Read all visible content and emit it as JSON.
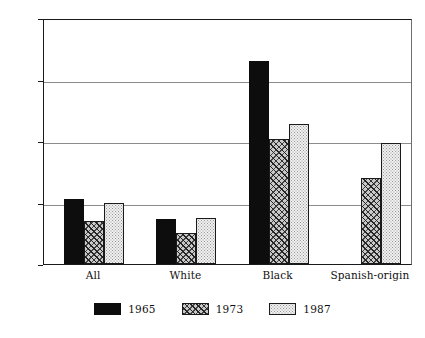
{
  "chart_data": {
    "type": "bar",
    "title": "",
    "subtitle": "",
    "xlabel": "",
    "ylabel": "",
    "categories": [
      "All",
      "White",
      "Black",
      "Spanish-origin"
    ],
    "series": [
      {
        "name": "1965",
        "values": [
          21,
          14.5,
          66,
          null
        ]
      },
      {
        "name": "1973",
        "values": [
          14,
          10,
          40.5,
          28
        ]
      },
      {
        "name": "1987",
        "values": [
          20,
          15,
          45.5,
          39.5
        ]
      }
    ],
    "ylim": [
      0,
      80
    ],
    "yticks": [
      0,
      20,
      40,
      60,
      80
    ],
    "ytick_labels": [
      "0",
      "20",
      "40",
      "60",
      "80"
    ],
    "grid": true,
    "grid_axis": "y",
    "legend_position": "bottom",
    "annotations": []
  },
  "style": {
    "bar_1965_fill": "#0d0d0d",
    "bar_1973_fill": "#c9c9c9",
    "bar_1987_fill": "#f0f0f0",
    "axis_color": "#1a1a1a",
    "grid_color": "#8c8c8c",
    "background": "#ffffff"
  }
}
